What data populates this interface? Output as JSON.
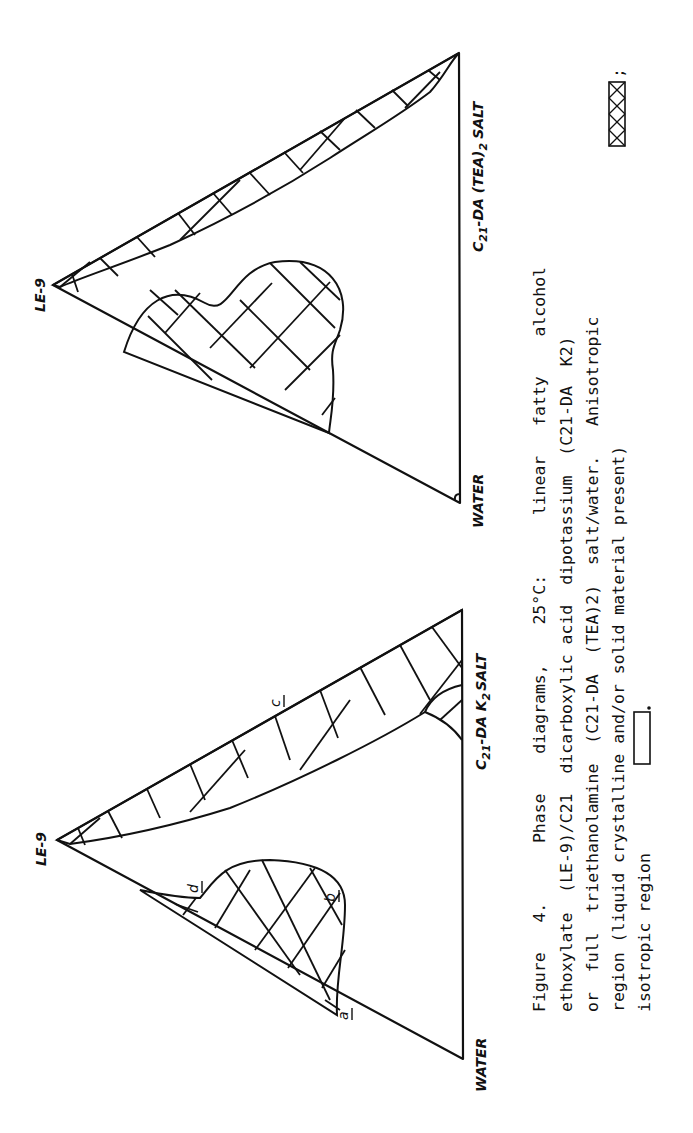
{
  "figure": {
    "number": "4",
    "caption_lines": [
      "Figure   4.      Phase    diagrams,    25°C:      linear   fatty    alcohol",
      "ethoxylate  (LE-9)/C21  dicarboxylic acid  dipotassium  (C21-DA  K2)",
      "or  full  triethanolamine  (C21-DA  (TEA)2)  salt/water.   Anisotropic",
      "region (liquid crystalline and/or solid material present)",
      "isotropic region"
    ],
    "legend": {
      "anisotropic_symbol": "cross-hatched box",
      "anisotropic_suffix": ";",
      "isotropic_symbol": "empty box",
      "isotropic_suffix": "."
    }
  },
  "diagrams": [
    {
      "id": "left",
      "vertices": {
        "top": "LE-9",
        "bottom_left": "WATER",
        "bottom_right_prefix": "C",
        "bottom_right_sub": "21",
        "bottom_right_mid": "-DA  K",
        "bottom_right_sub2": "2",
        "bottom_right_suffix": "SALT"
      },
      "point_labels": [
        "a",
        "b",
        "c",
        "d"
      ]
    },
    {
      "id": "right",
      "vertices": {
        "top": "LE-9",
        "bottom_left": "WATER",
        "bottom_right_prefix": "C",
        "bottom_right_sub": "21",
        "bottom_right_mid": "-DA  (TEA)",
        "bottom_right_sub2": "2",
        "bottom_right_suffix": "SALT"
      },
      "point_labels": []
    }
  ]
}
